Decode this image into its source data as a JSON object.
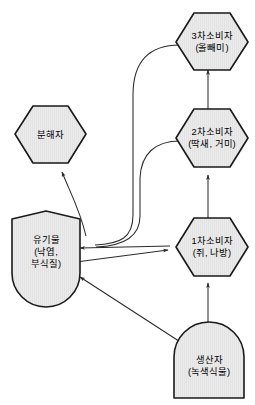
{
  "diagram": {
    "type": "ecosystem-energy-flow",
    "background_color": "#ffffff",
    "node_fill_color": "#e9e9e9",
    "node_border_color": "#1a1a1a",
    "arrow_color": "#2b2b2b",
    "nodes": [
      {
        "id": "tertiary-consumer",
        "shape": "hexagon",
        "line1": "3차소비자",
        "line2": "(올빼미)"
      },
      {
        "id": "secondary-consumer",
        "shape": "hexagon",
        "line1": "2차소비자",
        "line2": "(딱새, 거미)"
      },
      {
        "id": "primary-consumer",
        "shape": "hexagon",
        "line1": "1차소비자",
        "line2": "(쥐, 나방)"
      },
      {
        "id": "decomposer",
        "shape": "hexagon",
        "line1": "분해자",
        "line2": ""
      },
      {
        "id": "organic-matter",
        "shape": "rounded-bottom",
        "line1": "유기물",
        "line2": "(낙엽,",
        "line3": "부식질)"
      },
      {
        "id": "producer",
        "shape": "rounded-top",
        "line1": "생산자",
        "line2": "(녹색식물)"
      }
    ],
    "edges": [
      {
        "id": "producer-to-primary",
        "from": "producer",
        "to": "primary-consumer",
        "style": "straight-arrow"
      },
      {
        "id": "primary-to-secondary",
        "from": "primary-consumer",
        "to": "secondary-consumer",
        "style": "straight-arrow"
      },
      {
        "id": "secondary-to-tertiary",
        "from": "secondary-consumer",
        "to": "tertiary-consumer",
        "style": "straight-arrow"
      },
      {
        "id": "producer-to-organic",
        "from": "producer",
        "to": "organic-matter",
        "style": "straight-arrow"
      },
      {
        "id": "primary-to-organic",
        "from": "primary-consumer",
        "to": "organic-matter",
        "style": "straight-arrow"
      },
      {
        "id": "organic-to-primary",
        "from": "organic-matter",
        "to": "primary-consumer",
        "style": "straight-arrow"
      },
      {
        "id": "organic-to-decomposer",
        "from": "organic-matter",
        "to": "decomposer",
        "style": "curved-arrow"
      },
      {
        "id": "secondary-to-organic",
        "from": "secondary-consumer",
        "to": "organic-matter",
        "style": "curved-line"
      },
      {
        "id": "tertiary-to-organic",
        "from": "tertiary-consumer",
        "to": "organic-matter",
        "style": "curved-line"
      }
    ]
  }
}
